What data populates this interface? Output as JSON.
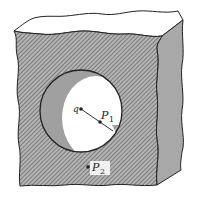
{
  "diagram": {
    "labels": {
      "charge": "q",
      "point1": "P",
      "point1_sub": "1",
      "point2": "P",
      "point2_sub": "2"
    },
    "colors": {
      "front_face": "#9c9c9c",
      "hatch": "#5a5a5a",
      "side_face": "#a8a8a8",
      "top_face": "#ffffff",
      "cavity_shadow": "#a0a0a0",
      "cavity_light": "#ffffff",
      "outline": "#222222"
    }
  }
}
